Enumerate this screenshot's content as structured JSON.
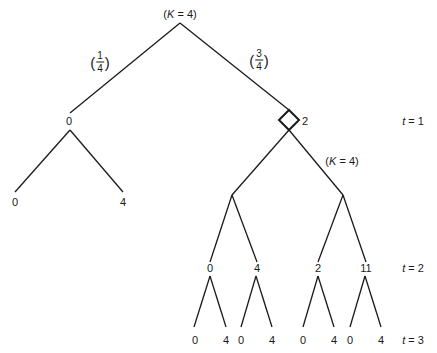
{
  "diagram": {
    "type": "binomial-tree",
    "root": {
      "label_prefix": "(",
      "label_var": "K",
      "label_rest": " = 4)"
    },
    "edge_probabilities": {
      "left": {
        "numerator": "1",
        "denominator": "4"
      },
      "right": {
        "numerator": "3",
        "denominator": "4"
      }
    },
    "t1": {
      "left_value": "0",
      "right_value": "2",
      "right_annotation": {
        "label_prefix": "(",
        "label_var": "K",
        "label_rest": " = 4)"
      },
      "left_children": [
        "0",
        "4"
      ]
    },
    "t2": {
      "values": [
        "0",
        "4",
        "2",
        "11"
      ]
    },
    "t3": {
      "values": [
        "0",
        "4",
        "0",
        "4",
        "0",
        "4",
        "0",
        "4"
      ]
    },
    "time_labels": [
      {
        "var": "t",
        "rest": " = 1"
      },
      {
        "var": "t",
        "rest": " = 2"
      },
      {
        "var": "t",
        "rest": " = 3"
      }
    ],
    "line_color": "#1a1a1a"
  }
}
